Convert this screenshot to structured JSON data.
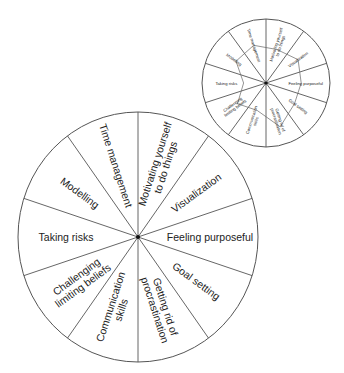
{
  "main_wheel": {
    "center": [
      138,
      237
    ],
    "rx": 120,
    "ry": 125,
    "segments": [
      {
        "lines": [
          "Motivating yourself",
          "to do things"
        ]
      },
      {
        "lines": [
          "Visualization"
        ]
      },
      {
        "lines": [
          "Feeling purposeful"
        ]
      },
      {
        "lines": [
          "Goal setting"
        ]
      },
      {
        "lines": [
          "Getting rid of",
          "procrastination"
        ]
      },
      {
        "lines": [
          "Communication",
          "skills"
        ]
      },
      {
        "lines": [
          "Challenging",
          "limiting beliefs"
        ]
      },
      {
        "lines": [
          "Taking risks"
        ]
      },
      {
        "lines": [
          "Modelling"
        ]
      },
      {
        "lines": [
          "Time management"
        ]
      }
    ]
  },
  "small_wheel": {
    "center": [
      266,
      83
    ],
    "r": 64,
    "segments": [
      {
        "lines": [
          "Motivating yourself",
          "to do things"
        ]
      },
      {
        "lines": [
          "Visualization"
        ]
      },
      {
        "lines": [
          "Feeling purposeful"
        ]
      },
      {
        "lines": [
          "Goal setting"
        ]
      },
      {
        "lines": [
          "Getting rid of",
          "procrastination"
        ]
      },
      {
        "lines": [
          "Communication",
          "skills"
        ]
      },
      {
        "lines": [
          "Challenging",
          "limiting beliefs"
        ]
      },
      {
        "lines": [
          "Taking risks"
        ]
      },
      {
        "lines": [
          "Modelling"
        ]
      },
      {
        "lines": [
          "Time management"
        ]
      }
    ],
    "scores_fraction": [
      0.55,
      0.62,
      0.55,
      0.55,
      0.72,
      0.45,
      0.55,
      0.35,
      0.58,
      0.62
    ]
  },
  "colors": {
    "line": "#555555",
    "text": "#222222",
    "background": "#ffffff"
  }
}
